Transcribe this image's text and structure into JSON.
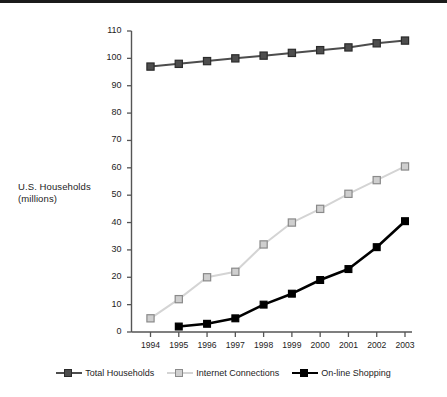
{
  "chart_data": {
    "type": "line",
    "title": "",
    "subtitle": "",
    "xlabel": "",
    "ylabel": "U.S. Households\n(millions)",
    "ylabel_line1": "U.S. Households",
    "ylabel_line2": "(millions)",
    "categories": [
      "1994",
      "1995",
      "1996",
      "1997",
      "1998",
      "1999",
      "2000",
      "2001",
      "2002",
      "2003"
    ],
    "x": [
      1994,
      1995,
      1996,
      1997,
      1998,
      1999,
      2000,
      2001,
      2002,
      2003
    ],
    "ylim": [
      0,
      110
    ],
    "ytick_step": 10,
    "yticks": [
      0,
      10,
      20,
      30,
      40,
      50,
      60,
      70,
      80,
      90,
      100,
      110
    ],
    "ytick_labels": [
      "0",
      "10",
      "20",
      "30",
      "40",
      "50",
      "60",
      "70",
      "80",
      "90",
      "100",
      "110"
    ],
    "grid": false,
    "legend_position": "bottom",
    "series": [
      {
        "name": "Total Households",
        "color": "#4d4d4d",
        "marker_fill": "#4d4d4d",
        "marker_edge": "#2b2b2b",
        "values": [
          97,
          98,
          99,
          100,
          101,
          102,
          103,
          104,
          105.5,
          106.5
        ]
      },
      {
        "name": "Internet Connections",
        "color": "#d4d4d4",
        "marker_fill": "#cfcfcf",
        "marker_edge": "#8a8a8a",
        "values": [
          5,
          12,
          20,
          22,
          32,
          40,
          45,
          50.5,
          55.5,
          60.5
        ]
      },
      {
        "name": "On-line Shopping",
        "color": "#000000",
        "marker_fill": "#000000",
        "marker_edge": "#000000",
        "values": [
          null,
          2,
          3,
          5,
          10,
          14,
          19,
          23,
          31,
          40.5
        ]
      }
    ]
  },
  "axis": {
    "label_line1": "U.S. Households",
    "label_line2": "(millions)"
  },
  "legend": {
    "items": [
      {
        "label": "Total Households",
        "color": "#4d4d4d",
        "fill": "#4d4d4d",
        "edge": "#2b2b2b"
      },
      {
        "label": "Internet Connections",
        "color": "#d4d4d4",
        "fill": "#cfcfcf",
        "edge": "#8a8a8a"
      },
      {
        "label": "On-line Shopping",
        "color": "#000000",
        "fill": "#000000",
        "edge": "#000000"
      }
    ]
  },
  "colors": {
    "axis": "#555555",
    "text": "#1d1d1d",
    "background": "#ffffff",
    "scan_bar": "#1b1b1b"
  }
}
